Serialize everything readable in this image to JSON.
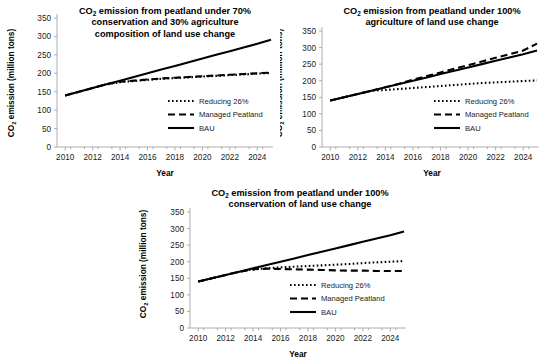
{
  "figure": {
    "panel_count": 3,
    "background": "#ffffff",
    "line_color": "#000000",
    "axis_color": "#9a9a9a"
  },
  "common": {
    "xlabel": "Year",
    "ylabel_main": "CO",
    "ylabel_sub": "2",
    "ylabel_rest": " emission (million tons)",
    "yticks": [
      "0",
      "50",
      "100",
      "150",
      "200",
      "250",
      "300",
      "350"
    ],
    "xticks": [
      "2010",
      "2012",
      "2014",
      "2016",
      "2018",
      "2020",
      "2022",
      "2024"
    ],
    "legend": [
      {
        "label": "Reducing 26%",
        "style": "dotted",
        "name": "reducing"
      },
      {
        "label": "Managed Peatland",
        "style": "dashed",
        "name": "managed"
      },
      {
        "label": "BAU",
        "style": "solid",
        "name": "bau"
      }
    ]
  },
  "panels": [
    {
      "id": "panel-1",
      "title_line1": "CO",
      "title_sub": "2",
      "title_line1_rest": " emission from peatland under 70%",
      "title_line2": "conservation and 30% agriculture",
      "title_line3": "composition of land use change"
    },
    {
      "id": "panel-2",
      "title_line1": "CO",
      "title_sub": "2",
      "title_line1_rest": " emission from peatland under 100%",
      "title_line2": "agriculture of land use change",
      "title_line3": ""
    },
    {
      "id": "panel-3",
      "title_line1": "CO",
      "title_sub": "2",
      "title_line1_rest": " emission from peatland under 100%",
      "title_line2": "conservation of land use change",
      "title_line3": ""
    }
  ],
  "chart_data": [
    {
      "type": "line",
      "title": "CO2 emission from peatland under 70% conservation and 30% agriculture composition of land use change",
      "xlabel": "Year",
      "ylabel": "CO2 emission (million tons)",
      "xlim": [
        2009.4,
        2025.0
      ],
      "ylim": [
        0,
        350
      ],
      "xticks": [
        2010,
        2012,
        2014,
        2016,
        2018,
        2020,
        2022,
        2024
      ],
      "yticks": [
        0,
        50,
        100,
        150,
        200,
        250,
        300,
        350
      ],
      "grid": false,
      "legend_position": "inside-lower-right",
      "x": [
        2010,
        2011,
        2012,
        2013,
        2014,
        2015,
        2016,
        2017,
        2018,
        2019,
        2020,
        2021,
        2022,
        2023,
        2024,
        2025
      ],
      "series": [
        {
          "name": "BAU",
          "style": "solid",
          "values": [
            140,
            150,
            160,
            170,
            180,
            190,
            200,
            210,
            220,
            230,
            240,
            250,
            260,
            270,
            280,
            291
          ]
        },
        {
          "name": "Managed Peatland",
          "style": "dashed",
          "values": [
            140,
            150,
            160,
            170,
            177,
            180,
            183,
            186,
            188,
            190,
            192,
            194,
            196,
            198,
            200,
            202
          ]
        },
        {
          "name": "Reducing 26%",
          "style": "dotted",
          "values": [
            140,
            150,
            160,
            170,
            176,
            179,
            182,
            185,
            187,
            189,
            191,
            193,
            195,
            197,
            199,
            201
          ]
        }
      ]
    },
    {
      "type": "line",
      "title": "CO2 emission from peatland under 100% agriculture of land use change",
      "xlabel": "Year",
      "ylabel": "CO2 emission (million tons)",
      "xlim": [
        2009.4,
        2025.0
      ],
      "ylim": [
        0,
        350
      ],
      "xticks": [
        2010,
        2012,
        2014,
        2016,
        2018,
        2020,
        2022,
        2024
      ],
      "yticks": [
        0,
        50,
        100,
        150,
        200,
        250,
        300,
        350
      ],
      "grid": false,
      "legend_position": "inside-lower-right",
      "x": [
        2010,
        2011,
        2012,
        2013,
        2014,
        2015,
        2016,
        2017,
        2018,
        2019,
        2020,
        2021,
        2022,
        2023,
        2024,
        2025
      ],
      "series": [
        {
          "name": "BAU",
          "style": "solid",
          "values": [
            140,
            150,
            160,
            170,
            180,
            190,
            200,
            210,
            220,
            230,
            240,
            250,
            260,
            270,
            280,
            291
          ]
        },
        {
          "name": "Managed Peatland",
          "style": "dashed",
          "values": [
            140,
            150,
            160,
            170,
            180,
            191,
            203,
            214,
            225,
            236,
            247,
            258,
            269,
            280,
            291,
            312
          ]
        },
        {
          "name": "Reducing 26%",
          "style": "dotted",
          "values": [
            140,
            150,
            160,
            170,
            172,
            175,
            178,
            181,
            184,
            187,
            190,
            193,
            195,
            197,
            199,
            201
          ]
        }
      ]
    },
    {
      "type": "line",
      "title": "CO2 emission from peatland under 100% conservation of land use change",
      "xlabel": "Year",
      "ylabel": "CO2 emission (million tons)",
      "xlim": [
        2009.4,
        2025.0
      ],
      "ylim": [
        0,
        350
      ],
      "xticks": [
        2010,
        2012,
        2014,
        2016,
        2018,
        2020,
        2022,
        2024
      ],
      "yticks": [
        0,
        50,
        100,
        150,
        200,
        250,
        300,
        350
      ],
      "grid": false,
      "legend_position": "inside-lower-right",
      "x": [
        2010,
        2011,
        2012,
        2013,
        2014,
        2015,
        2016,
        2017,
        2018,
        2019,
        2020,
        2021,
        2022,
        2023,
        2024,
        2025
      ],
      "series": [
        {
          "name": "BAU",
          "style": "solid",
          "values": [
            140,
            150,
            160,
            170,
            180,
            190,
            200,
            210,
            220,
            230,
            240,
            250,
            260,
            270,
            280,
            291
          ]
        },
        {
          "name": "Managed Peatland",
          "style": "dashed",
          "values": [
            140,
            150,
            160,
            170,
            177,
            179,
            178,
            177,
            176,
            175,
            174,
            173,
            173,
            172,
            172,
            172
          ]
        },
        {
          "name": "Reducing 26%",
          "style": "dotted",
          "values": [
            140,
            150,
            160,
            170,
            177,
            180,
            183,
            185,
            187,
            189,
            191,
            193,
            196,
            198,
            200,
            202
          ]
        }
      ]
    }
  ]
}
